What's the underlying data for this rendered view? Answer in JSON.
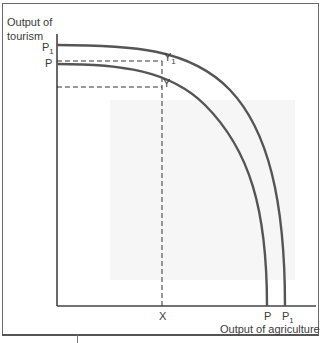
{
  "diagram": {
    "type": "production-possibility-frontier",
    "y_axis_label_line1": "Output of",
    "y_axis_label_line2": "tourism",
    "x_axis_label": "Output of agriculture",
    "curves": [
      {
        "name": "P1",
        "label": "P",
        "subscript": "1",
        "point_label": "Y",
        "point_subscript": "1"
      },
      {
        "name": "P",
        "label": "P",
        "subscript": "",
        "point_label": "Y",
        "point_subscript": ""
      }
    ],
    "x_marker": "X",
    "x_intercepts": [
      {
        "label": "P",
        "subscript": ""
      },
      {
        "label": "P",
        "subscript": "1"
      }
    ],
    "colors": {
      "curve": "#555555",
      "axis": "#444444",
      "text": "#3a3a3a"
    }
  }
}
